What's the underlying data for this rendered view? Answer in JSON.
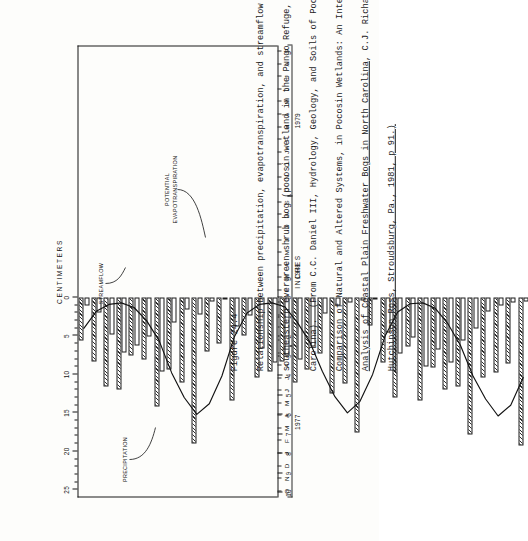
{
  "page": {
    "figure_number": "Figure 24.4",
    "orientation": "rotated-90-ccw"
  },
  "caption": {
    "line1": "Figure 24.4",
    "line2": "Relationship between precipitation, evapotranspiration, and streamflow in a",
    "line3": "southeastern evergreen shrub bog (pocosin wetland in the Pungo Refuge, North",
    "line4": "Carolina).  (From C.C. Daniel III, Hydrology, Geology, and Soils of Pocosins: A",
    "line5": "Comparison of Natural and Altered Systems, in Pocosin Wetlands: An Integrated",
    "line6_plain_a": "Analysis of Coastal Plain Freshwater Bogs in North Carolina",
    "line6_plain_b": ", C.J. Richardson, ed.,",
    "line7_underlined": "Hutchinson Ross, Stroudsburg, Pa., 1981, p 91.)"
  },
  "chart_data": {
    "type": "bar",
    "title": "",
    "xlabel": "",
    "ylabel_top": "CENTIMETERS",
    "ylabel_bottom": "INCHES",
    "grid": false,
    "legend_position": "in-plot-annotations",
    "top_axis": {
      "label": "CENTIMETERS",
      "ticks": [
        0,
        5,
        10,
        15,
        20,
        25
      ],
      "minor_step": 1,
      "range": [
        0,
        26
      ]
    },
    "bottom_axis": {
      "label": "INCHES",
      "ticks": [
        0,
        1,
        2,
        3,
        4,
        5,
        6,
        7,
        8,
        9,
        10
      ],
      "range": [
        0,
        10.24
      ]
    },
    "categories": [
      "O",
      "N",
      "D",
      "J",
      "F",
      "M",
      "A",
      "M",
      "J",
      "J",
      "A",
      "S",
      "O",
      "N",
      "D",
      "J",
      "F",
      "M",
      "A",
      "M",
      "J",
      "J",
      "A",
      "S",
      "O",
      "N",
      "D",
      "J",
      "F",
      "M",
      "A",
      "M",
      "J",
      "J",
      "A",
      "S"
    ],
    "year_groups": [
      {
        "label": "1977",
        "start": 0,
        "count": 12
      },
      {
        "label": "1978",
        "start": 12,
        "count": 12
      },
      {
        "label": "1979",
        "start": 24,
        "count": 12
      }
    ],
    "units": "centimeters",
    "series": [
      {
        "name": "PRECIPITATION",
        "style": "hatched-bar",
        "values": [
          5.6,
          8.3,
          11.6,
          12.0,
          7.6,
          8.1,
          14.2,
          9.4,
          11.1,
          19.0,
          7.0,
          6.0,
          13.4,
          5.0,
          10.4,
          9.6,
          8.3,
          11.0,
          9.4,
          7.3,
          12.5,
          11.2,
          17.5,
          3.6,
          8.4,
          13.0,
          6.4,
          13.4,
          9.1,
          12.0,
          11.6,
          17.8,
          10.4,
          9.8,
          8.6,
          19.3
        ]
      },
      {
        "name": "STREAMFLOW",
        "style": "open-bar",
        "values": [
          1.1,
          2.0,
          4.8,
          7.2,
          6.2,
          5.1,
          9.6,
          3.2,
          1.5,
          2.2,
          0.5,
          0.3,
          3.8,
          2.4,
          6.6,
          8.5,
          7.6,
          8.0,
          6.4,
          2.1,
          1.0,
          0.6,
          0.4,
          0.3,
          4.5,
          7.3,
          5.2,
          9.0,
          6.8,
          8.4,
          5.6,
          4.0,
          1.8,
          1.1,
          0.6,
          0.5
        ]
      },
      {
        "name": "POTENTIAL EVAPOTRANSPIRATION",
        "style": "line",
        "values": [
          4.0,
          1.8,
          0.9,
          0.7,
          1.3,
          3.0,
          5.6,
          9.8,
          13.0,
          15.2,
          13.8,
          10.2,
          5.1,
          2.0,
          0.9,
          0.7,
          1.2,
          3.2,
          5.8,
          9.6,
          12.9,
          15.0,
          13.5,
          10.0,
          5.0,
          1.9,
          0.8,
          0.7,
          1.4,
          3.4,
          6.2,
          10.2,
          13.2,
          15.4,
          14.0,
          10.4
        ]
      }
    ],
    "annotations": [
      {
        "text": "PRECIPITATION",
        "series": "PRECIPITATION"
      },
      {
        "text": "STREAMFLOW",
        "series": "STREAMFLOW"
      },
      {
        "text": "POTENTIAL\nEVAPOTRANSPIRATION",
        "series": "POTENTIAL EVAPOTRANSPIRATION"
      }
    ]
  },
  "labels": {
    "precipitation": "PRECIPITATION",
    "streamflow": "STREAMFLOW",
    "pet_line1": "POTENTIAL",
    "pet_line2": "EVAPOTRANSPIRATION",
    "centimeters": "CENTIMETERS",
    "inches": "INCHES"
  },
  "colors": {
    "ink": "#151515",
    "paper": "#fdfdfb",
    "hatch": "#2b2b2b"
  }
}
